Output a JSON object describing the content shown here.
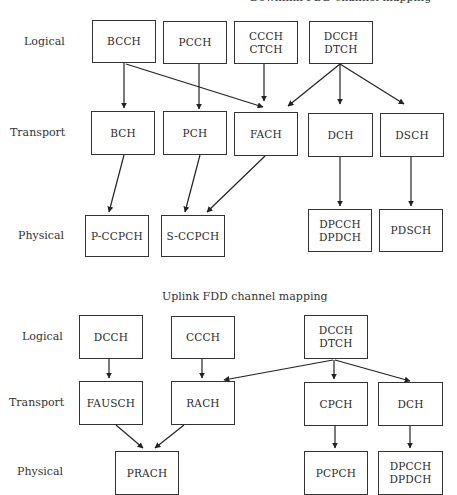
{
  "downlink": {
    "title": "Downlink FDD channel mapping",
    "row_labels": {
      "logical": "Logical",
      "transport": "Transport",
      "physical": "Physical"
    },
    "logical": [
      {
        "lines": [
          "BCCH"
        ]
      },
      {
        "lines": [
          "PCCH"
        ]
      },
      {
        "lines": [
          "CCCH",
          "CTCH"
        ]
      },
      {
        "lines": [
          "DCCH",
          "DTCH"
        ]
      }
    ],
    "transport": [
      {
        "lines": [
          "BCH"
        ]
      },
      {
        "lines": [
          "PCH"
        ]
      },
      {
        "lines": [
          "FACH"
        ]
      },
      {
        "lines": [
          "DCH"
        ]
      },
      {
        "lines": [
          "DSCH"
        ]
      }
    ],
    "physical": [
      {
        "lines": [
          "P-CCPCH"
        ]
      },
      {
        "lines": [
          "S-CCPCH"
        ]
      },
      {
        "lines": [
          "DPCCH",
          "DPDCH"
        ]
      },
      {
        "lines": [
          "PDSCH"
        ]
      }
    ],
    "mappings": [
      [
        "BCCH",
        "BCH"
      ],
      [
        "BCCH",
        "FACH"
      ],
      [
        "PCCH",
        "PCH"
      ],
      [
        "CCCH/CTCH",
        "FACH"
      ],
      [
        "DCCH/DTCH",
        "FACH"
      ],
      [
        "DCCH/DTCH",
        "DCH"
      ],
      [
        "DCCH/DTCH",
        "DSCH"
      ],
      [
        "BCH",
        "P-CCPCH"
      ],
      [
        "PCH",
        "S-CCPCH"
      ],
      [
        "FACH",
        "S-CCPCH"
      ],
      [
        "DCH",
        "DPCCH/DPDCH"
      ],
      [
        "DSCH",
        "PDSCH"
      ]
    ]
  },
  "uplink": {
    "title": "Uplink FDD channel mapping",
    "row_labels": {
      "logical": "Logical",
      "transport": "Transport",
      "physical": "Physical"
    },
    "logical": [
      {
        "lines": [
          "DCCH"
        ]
      },
      {
        "lines": [
          "CCCH"
        ]
      },
      {
        "lines": [
          "DCCH",
          "DTCH"
        ]
      }
    ],
    "transport": [
      {
        "lines": [
          "FAUSCH"
        ]
      },
      {
        "lines": [
          "RACH"
        ]
      },
      {
        "lines": [
          "CPCH"
        ]
      },
      {
        "lines": [
          "DCH"
        ]
      }
    ],
    "physical": [
      {
        "lines": [
          "PRACH"
        ]
      },
      {
        "lines": [
          "PCPCH"
        ]
      },
      {
        "lines": [
          "DPCCH",
          "DPDCH"
        ]
      }
    ],
    "mappings": [
      [
        "DCCH",
        "FAUSCH"
      ],
      [
        "CCCH",
        "RACH"
      ],
      [
        "DCCH/DTCH",
        "RACH"
      ],
      [
        "DCCH/DTCH",
        "CPCH"
      ],
      [
        "DCCH/DTCH",
        "DCH"
      ],
      [
        "FAUSCH",
        "PRACH"
      ],
      [
        "RACH",
        "PRACH"
      ],
      [
        "CPCH",
        "PCPCH"
      ],
      [
        "DCH",
        "DPCCH/DPDCH"
      ]
    ]
  }
}
